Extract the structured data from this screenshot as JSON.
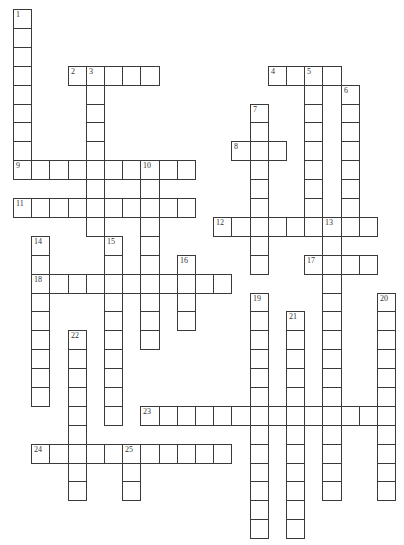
{
  "puzzle": {
    "type": "crossword",
    "grid": {
      "origin_x": 13,
      "origin_y": 9,
      "cell_w": 18.2,
      "cell_h": 18.9,
      "cols": 21,
      "rows": 28,
      "line_color": "#3a3a3a"
    },
    "entries": [
      {
        "number": "1",
        "direction": "down",
        "row": 0,
        "col": 0,
        "length": 9
      },
      {
        "number": "2",
        "direction": "across",
        "row": 3,
        "col": 3,
        "length": 5
      },
      {
        "number": "3",
        "direction": "down",
        "row": 3,
        "col": 4,
        "length": 9
      },
      {
        "number": "4",
        "direction": "across",
        "row": 3,
        "col": 14,
        "length": 4
      },
      {
        "number": "5",
        "direction": "down",
        "row": 3,
        "col": 16,
        "length": 9
      },
      {
        "number": "6",
        "direction": "down",
        "row": 4,
        "col": 18,
        "length": 8
      },
      {
        "number": "7",
        "direction": "down",
        "row": 5,
        "col": 13,
        "length": 9
      },
      {
        "number": "8",
        "direction": "across",
        "row": 7,
        "col": 12,
        "length": 3
      },
      {
        "number": "9",
        "direction": "across",
        "row": 8,
        "col": 0,
        "length": 10
      },
      {
        "number": "10",
        "direction": "down",
        "row": 8,
        "col": 7,
        "length": 10
      },
      {
        "number": "11",
        "direction": "across",
        "row": 10,
        "col": 0,
        "length": 10
      },
      {
        "number": "12",
        "direction": "across",
        "row": 11,
        "col": 11,
        "length": 9
      },
      {
        "number": "13",
        "direction": "down",
        "row": 11,
        "col": 17,
        "length": 15
      },
      {
        "number": "14",
        "direction": "down",
        "row": 12,
        "col": 1,
        "length": 9
      },
      {
        "number": "15",
        "direction": "down",
        "row": 12,
        "col": 5,
        "length": 10
      },
      {
        "number": "16",
        "direction": "down",
        "row": 13,
        "col": 9,
        "length": 4
      },
      {
        "number": "17",
        "direction": "across",
        "row": 13,
        "col": 16,
        "length": 4
      },
      {
        "number": "18",
        "direction": "across",
        "row": 14,
        "col": 1,
        "length": 11
      },
      {
        "number": "19",
        "direction": "down",
        "row": 15,
        "col": 13,
        "length": 13
      },
      {
        "number": "20",
        "direction": "down",
        "row": 15,
        "col": 20,
        "length": 11
      },
      {
        "number": "21",
        "direction": "down",
        "row": 16,
        "col": 15,
        "length": 12
      },
      {
        "number": "22",
        "direction": "down",
        "row": 17,
        "col": 3,
        "length": 9
      },
      {
        "number": "23",
        "direction": "across",
        "row": 21,
        "col": 7,
        "length": 14
      },
      {
        "number": "24",
        "direction": "across",
        "row": 23,
        "col": 1,
        "length": 11
      },
      {
        "number": "25",
        "direction": "down",
        "row": 23,
        "col": 6,
        "length": 3
      }
    ]
  }
}
